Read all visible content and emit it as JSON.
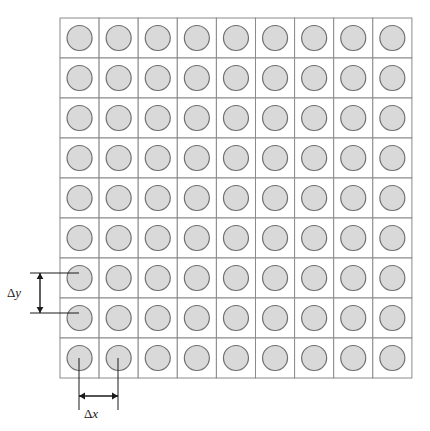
{
  "figure": {
    "name": "staggered-circle-grid",
    "background_color": "#ffffff"
  },
  "grid": {
    "rows": 9,
    "columns": 9,
    "origin_x": 60,
    "origin_y": 18,
    "cell_width": 39.1,
    "cell_height": 40.0,
    "line_color": "#8a8a8a",
    "line_width": 1,
    "fill_color": "#ffffff"
  },
  "circle": {
    "radius": 12.5,
    "fill_color": "#d9d9d9",
    "stroke_color": "#707070",
    "stroke_width": 1.2
  },
  "annotations": {
    "delta_y": {
      "label_delta": "Δ",
      "label_var": "y",
      "label_x": 14,
      "label_y": 297,
      "leader_top_y": 273,
      "leader_bottom_y": 313,
      "leader_left_x": 30,
      "leader_right_x": 79,
      "arrow_x": 40,
      "color": "#1a1a1a"
    },
    "delta_x": {
      "label_delta": "Δ",
      "label_var": "x",
      "label_x": 91,
      "label_y": 418,
      "leader_left_x": 79,
      "leader_right_x": 118,
      "leader_top_y": 358,
      "leader_bottom_y": 410,
      "arrow_y": 396,
      "color": "#1a1a1a"
    }
  },
  "chart_data": {
    "type": "scatter",
    "title": "",
    "xlabel": "Δx",
    "ylabel": "Δy",
    "grid": true,
    "legend": "none",
    "nx": 9,
    "ny": 9,
    "dx": 39.1,
    "dy": 40.0,
    "marker": "circle",
    "marker_size": 25,
    "marker_fill": "#d9d9d9",
    "marker_edge": "#707070"
  }
}
